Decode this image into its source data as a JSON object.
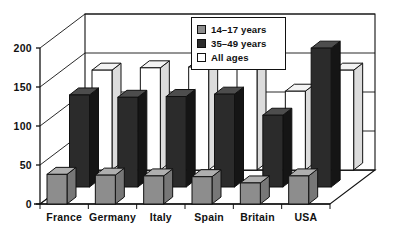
{
  "chart_data": {
    "type": "bar",
    "title": "",
    "subtitle": "",
    "xlabel": "",
    "ylabel": "",
    "ylim": [
      0,
      200
    ],
    "yticks": [
      0,
      50,
      100,
      150,
      200
    ],
    "grid": true,
    "legend_position": "top-center",
    "projection": "3d",
    "categories": [
      "France",
      "Germany",
      "Italy",
      "Spain",
      "Britain",
      "USA"
    ],
    "series": [
      {
        "name": "14–17 years",
        "color": "#8d8d8d",
        "values": [
          38,
          37,
          36,
          35,
          27,
          36
        ]
      },
      {
        "name": "35–49 years",
        "color": "#2b2b2b",
        "values": [
          118,
          115,
          116,
          119,
          92,
          178
        ]
      },
      {
        "name": "All ages",
        "color": "#ffffff",
        "values": [
          128,
          131,
          132,
          133,
          101,
          128
        ]
      }
    ]
  },
  "legend": {
    "items": [
      {
        "label": "14–17 years",
        "swatch": "gray-swatch"
      },
      {
        "label": "35–49 years",
        "swatch": "dark-swatch"
      },
      {
        "label": "All ages",
        "swatch": "white-swatch"
      }
    ]
  },
  "axis": {
    "y_labels": [
      "200",
      "150",
      "100",
      "50",
      "0"
    ],
    "x_labels": [
      "France",
      "Germany",
      "Italy",
      "Spain",
      "Britain",
      "USA"
    ]
  },
  "colors": {
    "series_front": "#8d8d8d",
    "series_middle": "#2b2b2b",
    "series_back": "#ffffff",
    "outline": "#111111",
    "grid": "#3a3a3a",
    "background": "#ffffff"
  }
}
